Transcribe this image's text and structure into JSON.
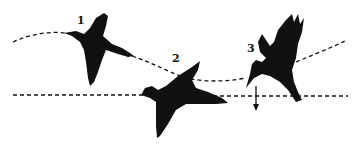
{
  "diagram": {
    "stages": [
      {
        "number": "1",
        "pose": "gliding"
      },
      {
        "number": "2",
        "pose": "descending"
      },
      {
        "number": "3",
        "pose": "plunging"
      }
    ],
    "lines": {
      "flight_path": "dashed curve",
      "water_surface": "dashed horizontal line"
    },
    "arrow": "down-arrow",
    "colors": {
      "ink": "#111111",
      "background": "#ffffff"
    }
  }
}
